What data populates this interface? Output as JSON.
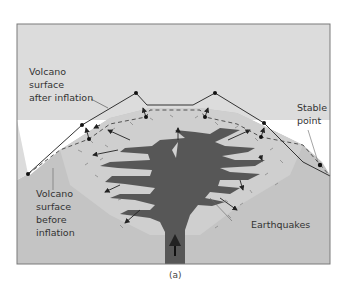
{
  "figure": {
    "caption": "(a)",
    "colors": {
      "sky": "#dcdcdc",
      "ground": "#c4c4c4",
      "inflated_zone": "#d2d2d2",
      "magma": "#575757",
      "frame": "#7a7a7a",
      "line": "#333333"
    },
    "labels": {
      "after_inflation": "Volcano\nsurface\nafter inflation",
      "before_inflation": "Volcano\nsurface\nbefore\ninflation",
      "stable_point": "Stable\npoint",
      "earthquakes": "Earthquakes"
    }
  }
}
